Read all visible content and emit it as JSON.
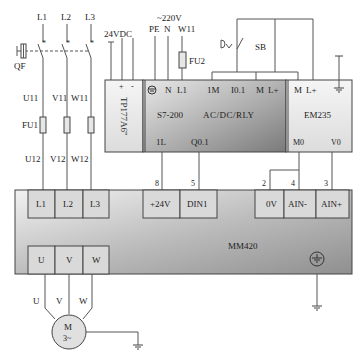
{
  "diagram": {
    "supply": {
      "lines": [
        "L1",
        "L2",
        "L3"
      ],
      "breaker": "QF"
    },
    "upper_wires": [
      "U11",
      "V11",
      "W11"
    ],
    "fuse1": "FU1",
    "lower_wires": [
      "U12",
      "V12",
      "W12"
    ],
    "hmi": {
      "supply_label": "24VDC",
      "terminals": [
        "+",
        "-"
      ],
      "name": "TP177A6\""
    },
    "plc_supply": {
      "voltage": "~220V",
      "wires": [
        "PE",
        "N",
        "W11"
      ],
      "fuse": "FU2"
    },
    "switch": {
      "label": "SB"
    },
    "plc": {
      "top_terminals": [
        "N",
        "L1",
        "1M",
        "I0.1",
        "M",
        "L+"
      ],
      "model": "S7-200",
      "type": "AC/DC/RLY",
      "bottom_terminals": [
        "1L",
        "Q0.1"
      ]
    },
    "analog_module": {
      "top_terminals": [
        "M",
        "L+"
      ],
      "name": "EM235",
      "bottom_terminals": [
        "M0",
        "V0"
      ]
    },
    "wire_numbers": [
      "8",
      "5",
      "2",
      "4",
      "3"
    ],
    "inverter": {
      "name": "MM420",
      "power_terminals": [
        "L1",
        "L2",
        "L3"
      ],
      "control_terminals": [
        "+24V",
        "DIN1"
      ],
      "analog_terminals": [
        "0V",
        "AIN-",
        "AIN+"
      ],
      "output_terminals": [
        "U",
        "V",
        "W"
      ]
    },
    "motor_wires": [
      "U",
      "V",
      "W"
    ],
    "motor": {
      "line1": "M",
      "line2": "3~"
    }
  }
}
